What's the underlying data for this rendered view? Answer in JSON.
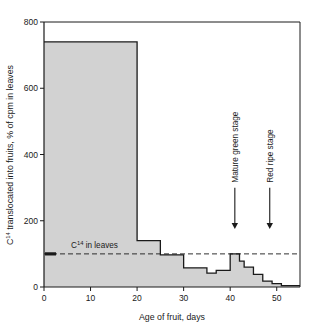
{
  "chart_data": {
    "type": "area",
    "title": "",
    "xlabel": "Age of fruit, days",
    "ylabel": "C14 translocated into fruits, % of cpm in leaves",
    "ylabel_parts": {
      "lead": "C",
      "sup": "14",
      "rest": " translocated into fruits, % of cpm in leaves"
    },
    "xlim": [
      0,
      55
    ],
    "ylim": [
      0,
      800
    ],
    "xticks": [
      0,
      10,
      20,
      30,
      40,
      50
    ],
    "xtick_labels": [
      "0",
      "10",
      "20",
      "30",
      "40",
      "50"
    ],
    "yticks": [
      0,
      200,
      400,
      600,
      800
    ],
    "ytick_labels": [
      "0",
      "200",
      "400",
      "600",
      "800"
    ],
    "grid": false,
    "legend": "none",
    "series": [
      {
        "name": "C14 translocated into fruits",
        "style": "step-area",
        "fill_color": "#d2d2d2",
        "line_color": "#1a1a1a",
        "steps": [
          {
            "x_start": 0,
            "x_end": 20,
            "value": 740
          },
          {
            "x_start": 20,
            "x_end": 25,
            "value": 140
          },
          {
            "x_start": 25,
            "x_end": 30,
            "value": 97
          },
          {
            "x_start": 30,
            "x_end": 35,
            "value": 58
          },
          {
            "x_start": 35,
            "x_end": 37,
            "value": 42
          },
          {
            "x_start": 37,
            "x_end": 40,
            "value": 50
          },
          {
            "x_start": 40,
            "x_end": 42,
            "value": 100
          },
          {
            "x_start": 42,
            "x_end": 43,
            "value": 78
          },
          {
            "x_start": 43,
            "x_end": 45,
            "value": 60
          },
          {
            "x_start": 45,
            "x_end": 47,
            "value": 38
          },
          {
            "x_start": 47,
            "x_end": 49,
            "value": 18
          },
          {
            "x_start": 49,
            "x_end": 51,
            "value": 10
          },
          {
            "x_start": 51,
            "x_end": 55,
            "value": 4
          }
        ]
      }
    ],
    "reference_line": {
      "label": "C14 in leaves",
      "label_parts": {
        "lead": "C",
        "sup": "14",
        "rest": " in leaves"
      },
      "value": 100,
      "style": "dashed",
      "color": "#1a1a1a",
      "x_start": 0,
      "x_end": 55,
      "marker": "left-tick"
    },
    "annotations": [
      {
        "text": "Mature green stage",
        "x": 41,
        "arrow": "down",
        "arrow_tip_value": 175,
        "arrow_tail_value": 300,
        "text_rotation": -90
      },
      {
        "text": "Red ripe stage",
        "x": 48.5,
        "arrow": "down",
        "arrow_tip_value": 175,
        "arrow_tail_value": 300,
        "text_rotation": -90
      }
    ],
    "colors": {
      "fill": "#d2d2d2",
      "axis": "#1a1a1a",
      "background": "#ffffff"
    }
  }
}
